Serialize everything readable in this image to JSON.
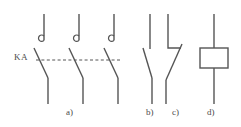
{
  "diagram": {
    "stroke_color": "#555555",
    "background_color": "#ffffff",
    "width": 241,
    "height": 127,
    "linkage_label": "KA",
    "figure_labels": [
      {
        "key": "a",
        "text": "a)",
        "meaning": "three-pole main contacts with arc suppression"
      },
      {
        "key": "b",
        "text": "b)",
        "meaning": "normally open auxiliary contact"
      },
      {
        "key": "c",
        "text": "c)",
        "meaning": "normally closed auxiliary contact"
      },
      {
        "key": "d",
        "text": "d)",
        "meaning": "operating coil"
      }
    ],
    "parts": {
      "a": {
        "name": "main-contacts",
        "pole_count": 3,
        "pole_x": [
          44,
          79,
          114
        ],
        "top_terminal_y": [
          14,
          40
        ],
        "hook_marker": "arc-suppression-hook",
        "blade_top": [
          34,
          48
        ],
        "blade_bottom": [
          48,
          78
        ],
        "bottom_terminal_y": [
          78,
          104
        ],
        "linkage_dashed_y": 60,
        "linkage_x": [
          36,
          122
        ]
      },
      "b": {
        "name": "no-contact",
        "terminal_x": 150,
        "top_terminal_y": [
          14,
          49
        ],
        "blade_top": [
          143,
          48
        ],
        "blade_bottom": [
          152,
          78
        ],
        "bottom_terminal_y": [
          78,
          104
        ]
      },
      "c": {
        "name": "nc-contact",
        "terminal_x": 168,
        "top_terminal_y": [
          14,
          48
        ],
        "jog_x": [
          168,
          181
        ],
        "jog_y": 48,
        "blade_top": [
          182,
          44
        ],
        "blade_bottom": [
          166,
          80
        ],
        "bottom_terminal_y": [
          80,
          104
        ]
      },
      "d": {
        "name": "coil",
        "center_x": 214,
        "rect": {
          "x": 200,
          "y": 48,
          "width": 28,
          "height": 20
        },
        "lead_top_y": [
          14,
          48
        ],
        "lead_bottom_y": [
          68,
          104
        ]
      }
    }
  }
}
